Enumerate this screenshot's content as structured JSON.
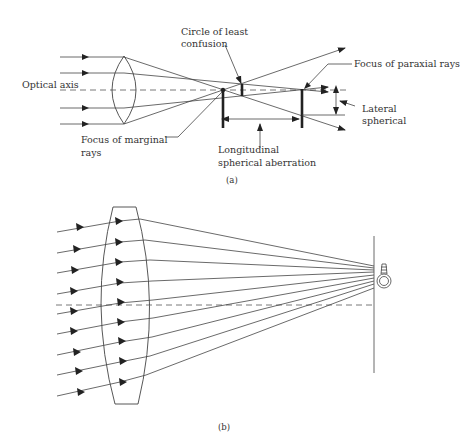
{
  "figure_a": {
    "caption": "(a)",
    "labels": {
      "optical_axis": "Optical axis",
      "circle_line1": "Circle of least",
      "circle_line2": "confusion",
      "paraxial": "Focus of paraxial rays",
      "lateral_line1": "Lateral",
      "lateral_line2": "spherical",
      "marginal_line1": "Focus of marginal",
      "marginal_line2": "rays",
      "longitudinal_line1": "Longitudinal",
      "longitudinal_line2": "spherical aberration"
    }
  },
  "figure_b": {
    "caption": "(b)"
  }
}
